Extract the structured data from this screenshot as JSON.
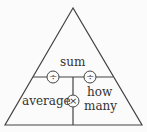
{
  "diagram": {
    "top_label": "sum",
    "bottom_left_label": "average",
    "bottom_right_label_line1": "how",
    "bottom_right_label_line2": "many",
    "operators": {
      "left_divide": "÷",
      "right_divide": "÷",
      "multiply": "×"
    },
    "colors": {
      "line": "#444444",
      "text": "#333333",
      "background": "#fbfbfb"
    }
  }
}
